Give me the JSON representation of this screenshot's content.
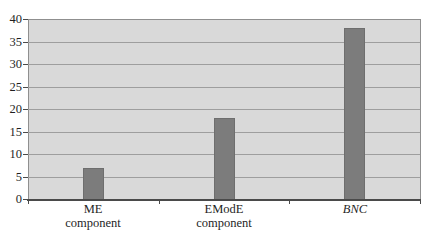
{
  "figure": {
    "background": "#ffffff"
  },
  "chart_data": {
    "type": "bar",
    "title": "",
    "xlabel": "",
    "ylabel": "",
    "categories": [
      "ME component",
      "EModE component",
      "BNC"
    ],
    "category_lines": [
      [
        "ME",
        "component"
      ],
      [
        "EModE",
        "component"
      ],
      [
        "BNC"
      ]
    ],
    "category_italic": [
      false,
      false,
      true
    ],
    "values": [
      7,
      18,
      38
    ],
    "ylim": [
      0,
      40
    ],
    "yticks": [
      0,
      5,
      10,
      15,
      20,
      25,
      30,
      35,
      40
    ],
    "grid": true,
    "legend": "none",
    "colors": {
      "figure_background": "#ffffff",
      "plot_background": "#d9d9d9",
      "gridline": "#9e9e9e",
      "plot_border": "#8f8f8f",
      "axis_line": "#4a4a4a",
      "bar_fill": "#7c7c7c",
      "bar_border": "#6e6e6e",
      "text": "#1f1f1f"
    }
  }
}
